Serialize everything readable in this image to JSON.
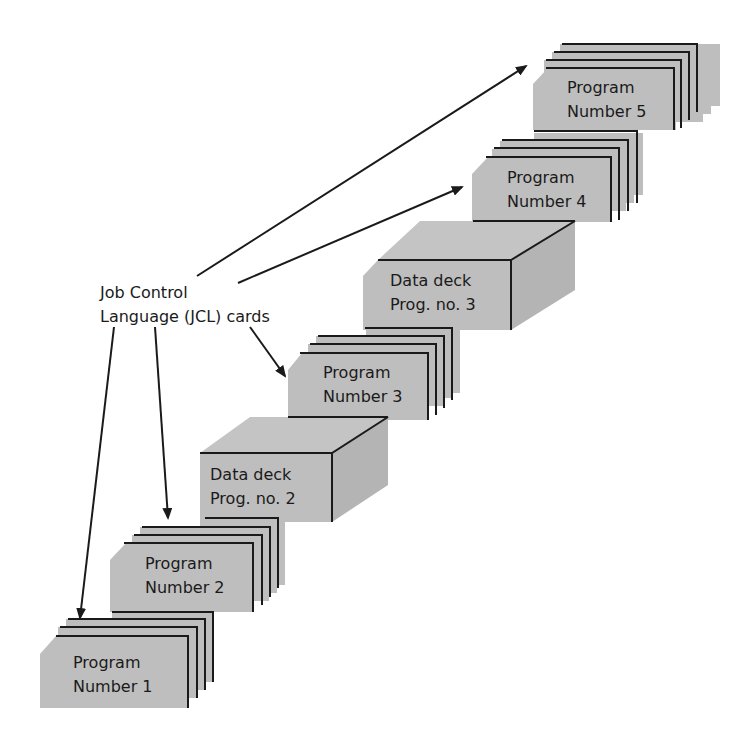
{
  "diagram": {
    "colors": {
      "deck_fill": "#bebebe",
      "line": "#1a1a1a",
      "background": "#ffffff"
    },
    "jcl_label": {
      "line1": "Job Control",
      "line2": "Language (JCL) cards"
    },
    "decks": [
      {
        "id": "program-1",
        "type": "program",
        "line1": "Program",
        "line2": "Number 1"
      },
      {
        "id": "program-2",
        "type": "program",
        "line1": "Program",
        "line2": "Number 2"
      },
      {
        "id": "data-deck-2",
        "type": "data",
        "line1": "Data deck",
        "line2": "Prog. no. 2"
      },
      {
        "id": "program-3",
        "type": "program",
        "line1": "Program",
        "line2": "Number 3"
      },
      {
        "id": "data-deck-3",
        "type": "data",
        "line1": "Data deck",
        "line2": "Prog. no. 3"
      },
      {
        "id": "program-4",
        "type": "program",
        "line1": "Program",
        "line2": "Number 4"
      },
      {
        "id": "program-5",
        "type": "program",
        "line1": "Program",
        "line2": "Number 5"
      }
    ],
    "arrows": [
      {
        "from": "jcl-label",
        "to": "program-1"
      },
      {
        "from": "jcl-label",
        "to": "program-2"
      },
      {
        "from": "jcl-label",
        "to": "program-3"
      },
      {
        "from": "jcl-label",
        "to": "program-4"
      },
      {
        "from": "jcl-label",
        "to": "program-5"
      }
    ]
  }
}
